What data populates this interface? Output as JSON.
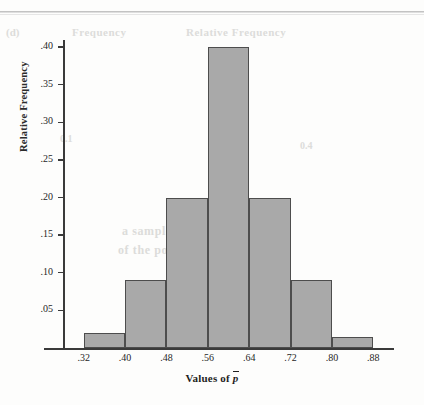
{
  "page": {
    "background_color": "#fdfdfc",
    "rule_color": "#b9b9b9",
    "ghost_text": {
      "a": "(d)",
      "b": "Frequency",
      "c": "Relative Frequency",
      "d": "a sample proportion near the",
      "e": "of the population proportion",
      "f": "0.1",
      "g": "0.4"
    }
  },
  "chart_data": {
    "type": "bar",
    "title": "",
    "subtitle": "",
    "xlabel": "Values of p̄",
    "xlabel_prefix": "Values of ",
    "xlabel_symbol": "p",
    "ylabel": "Relative Frequency",
    "categories": [
      ".32–.40",
      ".40–.48",
      ".48–.56",
      ".56–.64",
      ".64–.72",
      ".72–.80",
      ".80–.88"
    ],
    "bin_edges": [
      0.32,
      0.4,
      0.48,
      0.56,
      0.64,
      0.72,
      0.8,
      0.88
    ],
    "values": [
      0.02,
      0.09,
      0.2,
      0.4,
      0.2,
      0.09,
      0.015
    ],
    "xlim": [
      0.28,
      0.92
    ],
    "ylim": [
      0.0,
      0.425
    ],
    "xticks": [
      0.32,
      0.4,
      0.48,
      0.56,
      0.64,
      0.72,
      0.8,
      0.88
    ],
    "xtick_labels": [
      ".32",
      ".40",
      ".48",
      ".56",
      ".64",
      ".72",
      ".80",
      ".88"
    ],
    "yticks": [
      0.05,
      0.1,
      0.15,
      0.2,
      0.25,
      0.3,
      0.35,
      0.4
    ],
    "ytick_labels": [
      ".05",
      ".10",
      ".15",
      ".20",
      ".25",
      ".30",
      ".35",
      ".40"
    ],
    "grid": false,
    "legend": null,
    "bar_fill_color": "#a9a9a9",
    "bar_edge_color": "#4d4d4d",
    "axis_color": "#3a3a3a"
  }
}
